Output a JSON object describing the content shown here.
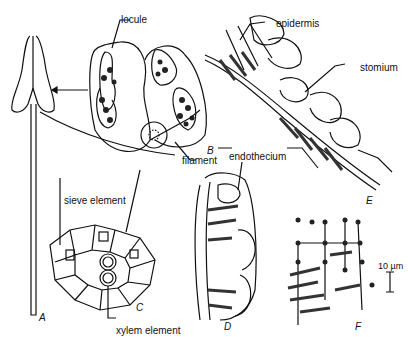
{
  "figure": {
    "labels": {
      "locule": "locule",
      "epidermis": "epidermis",
      "stomium": "stomium",
      "filament": "filament",
      "endothecium": "endothecium",
      "sieve_element": "sieve element",
      "xylem_element": "xylem element",
      "scale_bar": "10 µm"
    },
    "panels": {
      "A": "A",
      "B": "B",
      "C": "C",
      "D": "D",
      "E": "E",
      "F": "F"
    }
  }
}
